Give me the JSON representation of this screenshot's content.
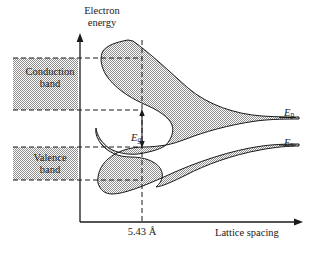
{
  "figure": {
    "type": "band-structure-diagram",
    "axes": {
      "y_label_line1": "Electron",
      "y_label_line2": "energy",
      "x_label": "Lattice spacing",
      "x_tick_label": "5.43 Å"
    },
    "boxes": [
      {
        "line1": "Conduction",
        "line2": "band"
      },
      {
        "line1": "Valence",
        "line2": "band"
      }
    ],
    "annotations": {
      "gap_symbol": "E",
      "gap_subscript": "g"
    },
    "right_levels": [
      {
        "symbol": "E",
        "subscript": "p"
      },
      {
        "symbol": "E",
        "subscript": "s"
      }
    ],
    "colors": {
      "band_fill": "#a8a8a8",
      "stroke": "#1a1a1a",
      "background": "#ffffff"
    }
  }
}
